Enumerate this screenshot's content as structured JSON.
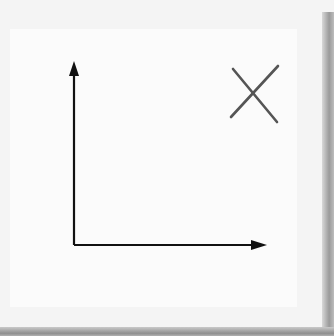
{
  "chart_data": {
    "type": "scatter",
    "title": "",
    "xlabel": "x",
    "ylabel": "y",
    "origin_label": "O",
    "x_ticks": [
      "0",
      "2",
      "4"
    ],
    "y_ticks": [
      "0",
      "2",
      "4"
    ],
    "points": [
      {
        "x": 0,
        "y": 1
      },
      {
        "x": 1,
        "y": 2
      },
      {
        "x": 2,
        "y": 3
      },
      {
        "x": 3,
        "y": 4
      },
      {
        "x": 4,
        "y": 5
      }
    ],
    "xlim": [
      -2,
      7
    ],
    "ylim": [
      -2,
      7
    ],
    "grid": true,
    "annotation": "cross mark (X) in upper right indicating incorrect"
  },
  "labels": {
    "y_axis": "y",
    "x_axis": "x",
    "origin_x": "O",
    "origin_y": "O",
    "x2": "2",
    "x4": "4",
    "y2": "2",
    "y4": "4"
  },
  "colors": {
    "grid": "#a9a9a9",
    "axis": "#111111",
    "point": "#6a6a6a",
    "cross": "#555555",
    "paper": "#fbfbfb"
  }
}
